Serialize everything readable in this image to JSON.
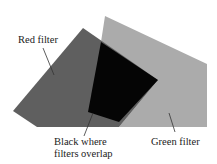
{
  "diagram": {
    "labels": {
      "red_filter": "Red filter",
      "green_filter": "Green filter",
      "overlap_line1": "Black where",
      "overlap_line2": "filters overlap"
    },
    "colors": {
      "red_filter": "#5f5f5f",
      "green_filter": "#ababab",
      "overlap": "#050505",
      "text": "#222222",
      "leader": "#333333"
    }
  }
}
